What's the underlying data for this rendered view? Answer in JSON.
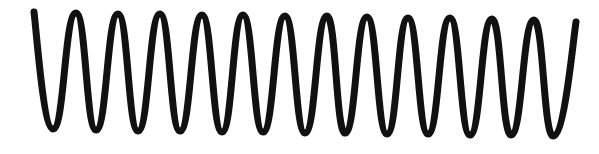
{
  "figure": {
    "stroke_color": "#111111",
    "background_color": "#ffffff",
    "stroke_width": 7,
    "start": [
      34,
      12
    ],
    "end": [
      576,
      22
    ],
    "extrema": [
      [
        53,
        129
      ],
      [
        76,
        13
      ],
      [
        96,
        130
      ],
      [
        118,
        14
      ],
      [
        138,
        131
      ],
      [
        160,
        14
      ],
      [
        180,
        131
      ],
      [
        202,
        15
      ],
      [
        222,
        132
      ],
      [
        243,
        15
      ],
      [
        263,
        132
      ],
      [
        285,
        16
      ],
      [
        305,
        133
      ],
      [
        327,
        16
      ],
      [
        345,
        133
      ],
      [
        367,
        17
      ],
      [
        387,
        134
      ],
      [
        408,
        18
      ],
      [
        428,
        134
      ],
      [
        450,
        18
      ],
      [
        470,
        135
      ],
      [
        492,
        19
      ],
      [
        511,
        135
      ],
      [
        534,
        20
      ],
      [
        553,
        136
      ]
    ],
    "peak_count": 12,
    "trough_count": 13
  }
}
